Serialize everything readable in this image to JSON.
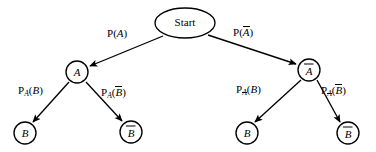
{
  "diagram": {
    "type": "probability-tree",
    "title_node": "Start",
    "background_color": "#ffffff",
    "stroke_color": "#000000",
    "nodes": [
      {
        "id": "start",
        "label": "Start",
        "shape": "ellipse",
        "cx": 185,
        "cy": 23,
        "rx": 30,
        "ry": 15,
        "level": 0
      },
      {
        "id": "a",
        "label": "A",
        "overline": false,
        "shape": "circle",
        "cx": 77,
        "cy": 72,
        "r": 11,
        "level": 1
      },
      {
        "id": "anot",
        "label": "A",
        "overline": true,
        "shape": "circle",
        "cx": 309,
        "cy": 70,
        "r": 11,
        "level": 1
      },
      {
        "id": "b_left",
        "label": "B",
        "overline": false,
        "shape": "circle",
        "cx": 25,
        "cy": 133,
        "r": 11,
        "level": 2
      },
      {
        "id": "bnot_left",
        "label": "B",
        "overline": true,
        "shape": "circle",
        "cx": 131,
        "cy": 132,
        "r": 11,
        "level": 2
      },
      {
        "id": "b_right",
        "label": "B",
        "overline": false,
        "shape": "circle",
        "cx": 247,
        "cy": 133,
        "r": 11,
        "level": 2
      },
      {
        "id": "bnot_right",
        "label": "B",
        "overline": true,
        "shape": "circle",
        "cx": 348,
        "cy": 133,
        "r": 11,
        "level": 2
      }
    ],
    "edges": [
      {
        "id": "edge-start-a",
        "from": "start",
        "to": "a",
        "arrowhead": true
      },
      {
        "id": "edge-start-anot",
        "from": "start",
        "to": "anot",
        "arrowhead": true
      },
      {
        "id": "edge-a-b",
        "from": "a",
        "to": "b_left",
        "arrowhead": true
      },
      {
        "id": "edge-a-bnot",
        "from": "a",
        "to": "bnot_left",
        "arrowhead": true
      },
      {
        "id": "edge-anot-b",
        "from": "anot",
        "to": "b_right",
        "arrowhead": true
      },
      {
        "id": "edge-anot-bnot",
        "from": "anot",
        "to": "bnot_right",
        "arrowhead": true
      }
    ],
    "edge_labels": {
      "p_a": {
        "prefix": "P",
        "subscript": "",
        "arg": "A",
        "arg_overline": false,
        "x": 107,
        "y": 28
      },
      "p_a_not": {
        "prefix": "P",
        "subscript": "",
        "arg": "A",
        "arg_overline": true,
        "x": 233,
        "y": 26
      },
      "p_a_of_b": {
        "prefix": "P",
        "subscript": "A",
        "sub_overline": false,
        "arg": "B",
        "arg_overline": false,
        "x": 18,
        "y": 85
      },
      "p_a_of_bnot": {
        "prefix": "P",
        "subscript": "A",
        "sub_overline": false,
        "arg": "B",
        "arg_overline": true,
        "x": 101,
        "y": 86
      },
      "p_anot_of_b": {
        "prefix": "P",
        "subscript": "A",
        "sub_overline": true,
        "arg": "B",
        "arg_overline": false,
        "x": 236,
        "y": 84
      },
      "p_anot_of_bnot": {
        "prefix": "P",
        "subscript": "A",
        "sub_overline": true,
        "arg": "B",
        "arg_overline": true,
        "x": 321,
        "y": 84
      }
    }
  }
}
